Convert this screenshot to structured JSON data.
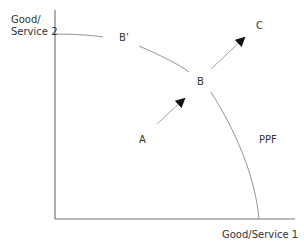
{
  "diagram": {
    "y_axis_label_line1": "Good/",
    "y_axis_label_line2": "Service 2",
    "x_axis_label": "Good/Service 1",
    "curve_label": "PPF",
    "points": {
      "a": "A",
      "b": "B",
      "b_prime": "B’",
      "c": "C"
    },
    "colors": {
      "axis": "#777777",
      "curve": "#888888",
      "arrow": "#222222",
      "text": "#333333"
    }
  }
}
